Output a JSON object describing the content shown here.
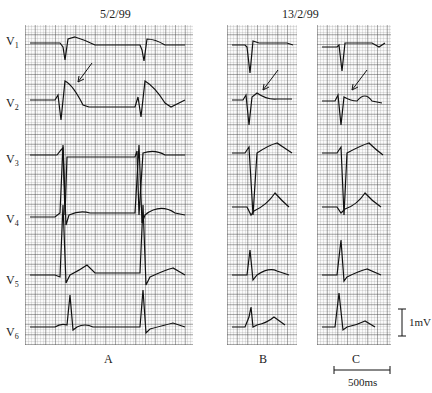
{
  "figure": {
    "dates": [
      "5/2/99",
      "13/2/99"
    ],
    "leads": [
      "V1",
      "V2",
      "V3",
      "V4",
      "V5",
      "V6"
    ],
    "panels": [
      {
        "label": "A",
        "date": "5/2/99"
      },
      {
        "label": "B",
        "date": "13/2/99"
      },
      {
        "label": "C",
        "date": "13/2/99"
      }
    ],
    "calibration": {
      "voltage": "1mV",
      "time": "500ms"
    },
    "annotation": "arrows in V2 mark ST segment"
  }
}
